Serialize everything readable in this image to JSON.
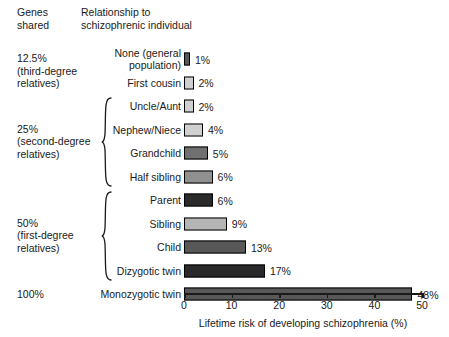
{
  "headers": {
    "genes_shared": "Genes\nshared",
    "relationship": "Relationship to\nschizophrenic individual"
  },
  "genes_groups": [
    {
      "label": "12.5%\n(third-degree\nrelatives)",
      "brace": false
    },
    {
      "label": "25%\n(second-degree\nrelatives)",
      "brace": true
    },
    {
      "label": "50%\n(first-degree\nrelatives)",
      "brace": true
    },
    {
      "label": "100%",
      "brace": false
    }
  ],
  "axis": {
    "ticks": [
      "0",
      "10",
      "20",
      "30",
      "40",
      "50"
    ],
    "title": "Lifetime risk of developing schizophrenia (%)"
  },
  "chart_data": {
    "type": "bar",
    "orientation": "horizontal",
    "title": "",
    "xlabel": "Lifetime risk of developing schizophrenia (%)",
    "ylabel": "Relationship to schizophrenic individual",
    "xlim": [
      0,
      50
    ],
    "xticks": [
      0,
      10,
      20,
      30,
      40,
      50
    ],
    "grid": false,
    "legend": "none",
    "categories": [
      "None (general population)",
      "First cousin",
      "Uncle/Aunt",
      "Nephew/Niece",
      "Grandchild",
      "Half sibling",
      "Parent",
      "Sibling",
      "Child",
      "Dizygotic twin",
      "Monozygotic twin"
    ],
    "values": [
      1,
      2,
      2,
      4,
      5,
      6,
      6,
      9,
      13,
      17,
      48
    ],
    "data_labels": [
      "1%",
      "2%",
      "2%",
      "4%",
      "5%",
      "6%",
      "6%",
      "9%",
      "13%",
      "17%",
      "48%"
    ],
    "genes_shared": [
      "12.5%",
      "12.5%",
      "25%",
      "25%",
      "25%",
      "25%",
      "50%",
      "50%",
      "50%",
      "50%",
      "100%"
    ],
    "bar_colors": [
      "#585858",
      "#d0d0d0",
      "#d0d0d0",
      "#d0d0d0",
      "#707070",
      "#909090",
      "#2a2a2a",
      "#b5b5b5",
      "#585858",
      "#2a2a2a",
      "#585858"
    ]
  },
  "rows": [
    {
      "label": "None (general\npopulation)",
      "value": 1,
      "data_label": "1%",
      "color": "#585858"
    },
    {
      "label": "First cousin",
      "value": 2,
      "data_label": "2%",
      "color": "#d0d0d0"
    },
    {
      "label": "Uncle/Aunt",
      "value": 2,
      "data_label": "2%",
      "color": "#d0d0d0"
    },
    {
      "label": "Nephew/Niece",
      "value": 4,
      "data_label": "4%",
      "color": "#d0d0d0"
    },
    {
      "label": "Grandchild",
      "value": 5,
      "data_label": "5%",
      "color": "#707070"
    },
    {
      "label": "Half sibling",
      "value": 6,
      "data_label": "6%",
      "color": "#909090"
    },
    {
      "label": "Parent",
      "value": 6,
      "data_label": "6%",
      "color": "#2a2a2a"
    },
    {
      "label": "Sibling",
      "value": 9,
      "data_label": "9%",
      "color": "#b5b5b5"
    },
    {
      "label": "Child",
      "value": 13,
      "data_label": "13%",
      "color": "#585858"
    },
    {
      "label": "Dizygotic twin",
      "value": 17,
      "data_label": "17%",
      "color": "#2a2a2a"
    },
    {
      "label": "Monozygotic twin",
      "value": 48,
      "data_label": "48%",
      "color": "#585858"
    }
  ]
}
